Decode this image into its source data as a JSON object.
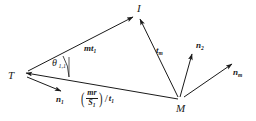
{
  "figure": {
    "type": "vector-geometry-diagram",
    "background": "#ffffff",
    "stroke_color": "#1a1a1a",
    "points": [
      {
        "id": "T",
        "label": "T",
        "x": 16,
        "y": 76
      },
      {
        "id": "I",
        "label": "I",
        "x": 137,
        "y": 12
      },
      {
        "id": "M",
        "label": "M",
        "x": 181,
        "y": 101
      }
    ],
    "vectors": [
      {
        "id": "mt1",
        "label": "mt",
        "subscript": "1",
        "from": "T",
        "to": "I"
      },
      {
        "id": "tm",
        "label": "t",
        "subscript": "m",
        "from": "M",
        "to": "I"
      },
      {
        "id": "n1",
        "label": "n",
        "subscript": "1",
        "from": "T",
        "to": "down-right"
      },
      {
        "id": "n2",
        "label": "n",
        "subscript": "2",
        "from": "M",
        "to": "up"
      },
      {
        "id": "nm",
        "label": "n",
        "subscript": "m",
        "from": "M",
        "to": "right"
      },
      {
        "id": "MT",
        "label": "",
        "subscript": "",
        "from": "M",
        "to": "T"
      }
    ],
    "angle": {
      "id": "theta-1-1",
      "symbol": "θ",
      "subscript": "1,1",
      "vertex": "T"
    },
    "formula": {
      "id": "mr-over-S1-over-t1",
      "open_paren": "(",
      "numerator": "mr",
      "denominator": "S",
      "denominator_sub": "1",
      "close_paren": ")",
      "slash": "/",
      "divisor": "t",
      "divisor_sub": "1"
    }
  }
}
